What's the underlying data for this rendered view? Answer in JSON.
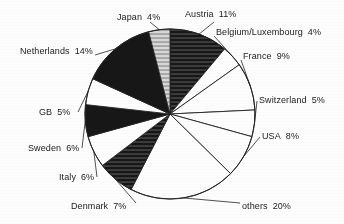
{
  "chart_data": {
    "type": "pie",
    "title": "",
    "xlabel": "",
    "ylabel": "",
    "legend_position": "outside-labels",
    "grid": false,
    "start_angle_deg": 0,
    "direction": "clockwise",
    "total_percent": 99,
    "categories": [
      "Austria",
      "Belgium/Luxembourg",
      "France",
      "Switzerland",
      "USA",
      "others",
      "Denmark",
      "Italy",
      "Sweden",
      "GB",
      "Netherlands",
      "Japan"
    ],
    "values": [
      11,
      4,
      9,
      5,
      8,
      20,
      7,
      6,
      6,
      5,
      14,
      4
    ],
    "slices": [
      {
        "label": "Austria",
        "value": 11,
        "percent_text": "11%",
        "fill": "dark-hatch"
      },
      {
        "label": "Belgium/Luxembourg",
        "value": 4,
        "percent_text": "4%",
        "fill": "white"
      },
      {
        "label": "France",
        "value": 9,
        "percent_text": "9%",
        "fill": "white"
      },
      {
        "label": "Switzerland",
        "value": 5,
        "percent_text": "5%",
        "fill": "white"
      },
      {
        "label": "USA",
        "value": 8,
        "percent_text": "8%",
        "fill": "white"
      },
      {
        "label": "others",
        "value": 20,
        "percent_text": "20%",
        "fill": "white"
      },
      {
        "label": "Denmark",
        "value": 7,
        "percent_text": "7%",
        "fill": "dark-hatch"
      },
      {
        "label": "Italy",
        "value": 6,
        "percent_text": "6%",
        "fill": "white"
      },
      {
        "label": "Sweden",
        "value": 6,
        "percent_text": "6%",
        "fill": "black"
      },
      {
        "label": "GB",
        "value": 5,
        "percent_text": "5%",
        "fill": "white"
      },
      {
        "label": "Netherlands",
        "value": 14,
        "percent_text": "14%",
        "fill": "black"
      },
      {
        "label": "Japan",
        "value": 4,
        "percent_text": "4%",
        "fill": "light-hatch"
      }
    ]
  },
  "labels": {
    "austria": {
      "name": "Austria",
      "pct": "11%"
    },
    "belgium": {
      "name": "Belgium/Luxembourg",
      "pct": "4%"
    },
    "france": {
      "name": "France",
      "pct": "9%"
    },
    "switzerland": {
      "name": "Switzerland",
      "pct": "5%"
    },
    "usa": {
      "name": "USA",
      "pct": "8%"
    },
    "others": {
      "name": "others",
      "pct": "20%"
    },
    "denmark": {
      "name": "Denmark",
      "pct": "7%"
    },
    "italy": {
      "name": "Italy",
      "pct": "6%"
    },
    "sweden": {
      "name": "Sweden",
      "pct": "6%"
    },
    "gb": {
      "name": "GB",
      "pct": "5%"
    },
    "netherlands": {
      "name": "Netherlands",
      "pct": "14%"
    },
    "japan": {
      "name": "Japan",
      "pct": "4%"
    }
  },
  "colors": {
    "ink": "#141414",
    "paper": "#fdfdfd",
    "dark_fill": "#171717",
    "light_fill": "#c9c9c9",
    "outline": "#242424"
  }
}
